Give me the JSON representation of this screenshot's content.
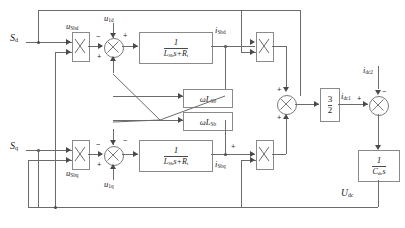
{
  "diagram": {
    "inputs": {
      "sd": "S",
      "sd_sub": "d",
      "sq": "S",
      "sq_sub": "q"
    },
    "labels": {
      "u_sbd": "u",
      "u_sbd_sub": "Sbd",
      "u_sbq": "u",
      "u_sbq_sub": "Sbq",
      "u_1d": "u",
      "u_1d_sub": "1d",
      "u_1q": "u",
      "u_1q_sub": "1q",
      "i_sbd": "i",
      "i_sbd_sub": "Sbd",
      "i_sbq": "i",
      "i_sbq_sub": "Sbq",
      "i_dc1": "i",
      "i_dc1_sub": "dc1",
      "i_dc2": "i",
      "i_dc2_sub": "dc2",
      "u_dc": "U",
      "u_dc_sub": "dc"
    },
    "blocks": {
      "tf_d": {
        "numerator": "1",
        "denominator": "L",
        "den_sub": "Sb",
        "den_rest": "s+R",
        "den_sub2": "i"
      },
      "tf_q": {
        "numerator": "1",
        "denominator": "L",
        "den_sub": "Sb",
        "den_rest": "s+R",
        "den_sub2": "i"
      },
      "coupling_top": {
        "text": "ωL",
        "sub": "Sb"
      },
      "coupling_bottom": {
        "text": "ωL",
        "sub": "Sb"
      },
      "gain": {
        "numerator": "3",
        "denominator": "2"
      },
      "cap": {
        "numerator": "1",
        "denominator": "C",
        "den_sub": "dc",
        "den_rest": "s"
      },
      "mult_d_left": "×",
      "mult_q_left": "×",
      "mult_d_right": "×",
      "mult_q_right": "×"
    },
    "signs": {
      "sum_d_minus": "−",
      "sum_d_plus_top": "+",
      "sum_d_plus_bottom": "+",
      "sum_q_minus_top": "−",
      "sum_q_minus_left": "−",
      "sum_q_plus": "+",
      "sum_center_plus_top": "+",
      "sum_center_plus_bottom": "+",
      "sum_dc_plus": "+",
      "sum_dc_minus": "−",
      "tf_d_out_plus": "+",
      "tf_q_out_plus": "+"
    },
    "colors": {
      "line": "#6b6b6b",
      "box_border": "#8a8a8a",
      "text": "#1a1a1a",
      "background": "#ffffff"
    }
  }
}
